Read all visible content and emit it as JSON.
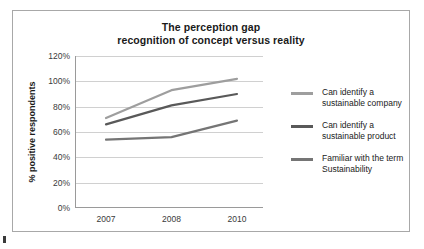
{
  "chart_data": {
    "type": "line",
    "title": "The perception gap recognition of concept versus reality",
    "title_line1": "The perception gap",
    "title_line2": "recognition of concept versus reality",
    "xlabel": "",
    "ylabel": "% positive respondents",
    "categories": [
      "2007",
      "2008",
      "2010"
    ],
    "x": [
      2007,
      2008,
      2010
    ],
    "ylim": [
      0,
      120
    ],
    "ytick_labels": [
      "0%",
      "20%",
      "40%",
      "60%",
      "80%",
      "100%",
      "120%"
    ],
    "ytick_values": [
      0,
      20,
      40,
      60,
      80,
      100,
      120
    ],
    "grid": true,
    "legend_position": "right",
    "series": [
      {
        "name": "Can identify a sustainable company",
        "name_line1": "Can identify a",
        "name_line2": "sustainable company",
        "values": [
          71,
          93,
          102
        ],
        "color": "#9e9e9e"
      },
      {
        "name": "Can identify a sustainable product",
        "name_line1": "Can identify a",
        "name_line2": "sustainable product",
        "values": [
          66,
          81,
          90
        ],
        "color": "#595959"
      },
      {
        "name": "Familiar with the term Sustainability",
        "name_line1": "Familiar with the term",
        "name_line2": "Sustainability",
        "values": [
          54,
          56,
          69
        ],
        "color": "#757575"
      }
    ]
  }
}
